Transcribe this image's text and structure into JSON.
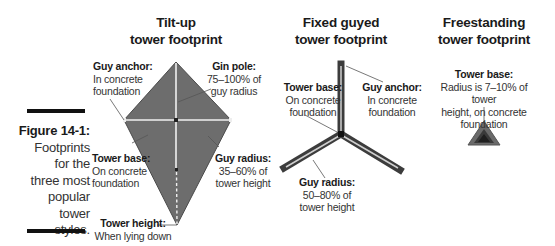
{
  "figure": {
    "number": "Figure 14-1:",
    "caption_lines": [
      "Footprints",
      "for the",
      "three most",
      "popular",
      "tower",
      "styles."
    ]
  },
  "diagrams": [
    {
      "id": "tilt-up",
      "title_line1": "Tilt-up",
      "title_line2": "tower footprint",
      "labels": {
        "guy_anchor": {
          "heading": "Guy anchor:",
          "line1": "In concrete",
          "line2": "foundation"
        },
        "gin_pole": {
          "heading": "Gin pole:",
          "line1": "75–100% of",
          "line2": "guy radius"
        },
        "tower_base": {
          "heading": "Tower base:",
          "line1": "On concrete",
          "line2": "foundation"
        },
        "guy_radius": {
          "heading": "Guy radius:",
          "line1": "35–60% of",
          "line2": "tower height"
        },
        "tower_height": {
          "heading": "Tower height:",
          "line1": "When lying down"
        }
      }
    },
    {
      "id": "fixed-guyed",
      "title_line1": "Fixed guyed",
      "title_line2": "tower footprint",
      "labels": {
        "tower_base": {
          "heading": "Tower base:",
          "line1": "On concrete",
          "line2": "foundation"
        },
        "guy_anchor": {
          "heading": "Guy anchor:",
          "line1": "In concrete",
          "line2": "foundation"
        },
        "guy_radius": {
          "heading": "Guy radius:",
          "line1": "50–80% of",
          "line2": "tower height"
        }
      }
    },
    {
      "id": "freestanding",
      "title_line1": "Freestanding",
      "title_line2": "tower footprint",
      "labels": {
        "tower_base": {
          "heading": "Tower base:",
          "line1": "Radius is 7–10% of tower",
          "line2": "height, on concrete",
          "line3": "foundation"
        }
      }
    }
  ],
  "colors": {
    "shape_fill": "#6b6b6b",
    "shape_dark": "#3a3a3a",
    "guideline": "#f2f2f2",
    "bar": "#111111"
  }
}
